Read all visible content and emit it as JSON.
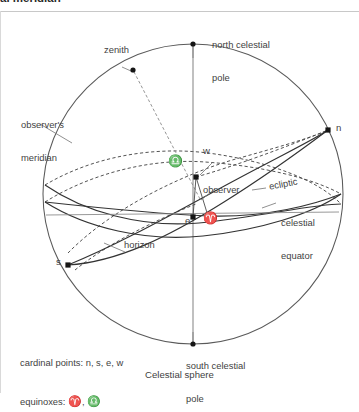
{
  "page": {
    "partial_header_text": "al meridian",
    "caption": "Celestial sphere"
  },
  "labels": {
    "north_celestial_pole_line1": "north celestial",
    "north_celestial_pole_line2": "pole",
    "south_celestial_pole_line1": "south celestial",
    "south_celestial_pole_line2": "pole",
    "zenith": "zenith",
    "observers_meridian_line1": "observer's",
    "observers_meridian_line2": "meridian",
    "observer": "observer",
    "ecliptic": "ecliptic",
    "celestial_equator_line1": "celestial",
    "celestial_equator_line2": "equator",
    "horizon": "horizon",
    "point_n": "n",
    "point_s": "s",
    "point_e": "e",
    "point_w": "w",
    "vernal_equinox_symbol": "♈",
    "autumnal_equinox_symbol": "♎"
  },
  "legend": {
    "cardinal_label": "cardinal points: ",
    "cardinal_values": "n, s, e, w",
    "equinoxes_label": "equinoxes: ",
    "equinox_symbol_vernal": "♈",
    "equinox_separator": ", ",
    "equinox_symbol_autumnal": "♎"
  },
  "diagram": {
    "type": "celestial-sphere-schematic",
    "sphere": {
      "center_x": 193,
      "center_y": 182,
      "radius": 150
    },
    "colors": {
      "outline": "#4a4a4a",
      "great_circle": "#3a3a3a",
      "hidden_dashed": "#4a4a4a",
      "axis": "#6b6b6b",
      "leader": "#6b6b6b",
      "marker": "#1a1a1a",
      "background": "#ffffff"
    },
    "marked_points": [
      {
        "name": "north celestial pole",
        "marker": "dot",
        "x": 193,
        "y": 32
      },
      {
        "name": "south celestial pole",
        "marker": "dot",
        "x": 193,
        "y": 332
      },
      {
        "name": "zenith",
        "marker": "dot",
        "x": 133,
        "y": 58
      },
      {
        "name": "n",
        "marker": "square",
        "x": 328,
        "y": 118
      },
      {
        "name": "s",
        "marker": "square",
        "x": 68,
        "y": 253
      },
      {
        "name": "w",
        "marker": "square",
        "x": 196,
        "y": 165
      },
      {
        "name": "e",
        "marker": "square",
        "x": 193,
        "y": 205
      },
      {
        "name": "vernal equinox",
        "marker": "square",
        "x": 208,
        "y": 204
      },
      {
        "name": "observer",
        "marker": "none",
        "x": 200,
        "y": 187
      }
    ],
    "great_circles": [
      {
        "name": "observer's meridian",
        "style": "solid-outline",
        "description": "bounding circle of the celestial sphere, seen edge-on as the limb"
      },
      {
        "name": "horizon",
        "style": "solid-front-dashed-back",
        "description": "tilted ellipse through s (lower left) and n (upper right), perpendicular to the zenith direction"
      },
      {
        "name": "celestial equator",
        "style": "solid-front-dashed-back",
        "description": "ellipse perpendicular to the polar axis, nearly edge-on, crossing near the centre"
      },
      {
        "name": "ecliptic",
        "style": "solid-front-dashed-back",
        "description": "ellipse inclined ~23.5 degrees to the celestial equator, intersecting it at the equinoxes"
      }
    ],
    "axes": [
      {
        "name": "polar axis",
        "from": "north celestial pole",
        "to": "south celestial pole",
        "style": "solid-thin-grey"
      },
      {
        "name": "zenith radius",
        "from": "observer",
        "to": "zenith",
        "style": "dashed-grey"
      }
    ]
  }
}
